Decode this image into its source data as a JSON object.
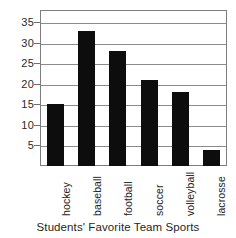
{
  "chart_data": {
    "type": "bar",
    "title": "",
    "caption": "Students' Favorite Team Sports",
    "xlabel": "Students' Favorite Team Sports",
    "ylabel": "",
    "categories": [
      "hockey",
      "baseball",
      "football",
      "soccer",
      "volleyball",
      "lacrosse"
    ],
    "values": [
      15,
      33,
      28,
      21,
      18,
      4
    ],
    "ylim": [
      0,
      38
    ],
    "yticks": [
      5,
      10,
      15,
      20,
      25,
      30,
      35
    ],
    "ytick_labels": [
      "5",
      "10",
      "15",
      "20",
      "25",
      "30",
      "35"
    ],
    "grid": true,
    "grid_axis": "y",
    "legend": false,
    "bar_color": "#0d0d0d",
    "frame_color": "#7d7d7d",
    "gridline_color": "#8c8c8c",
    "background": "#ffffff"
  }
}
